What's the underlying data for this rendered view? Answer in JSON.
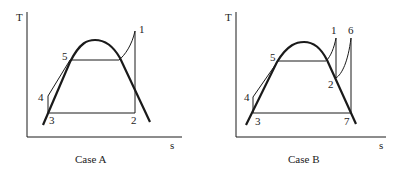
{
  "diagrams": [
    {
      "id": "case-a",
      "caption": "Case A",
      "axis_y_label": "T",
      "axis_x_label": "s",
      "points": {
        "p1": "1",
        "p2": "2",
        "p3": "3",
        "p4": "4",
        "p5": "5"
      }
    },
    {
      "id": "case-b",
      "caption": "Case B",
      "axis_y_label": "T",
      "axis_x_label": "s",
      "points": {
        "p1": "1",
        "p2": "2",
        "p3": "3",
        "p4": "4",
        "p5": "5",
        "p6": "6",
        "p7": "7"
      }
    }
  ],
  "colors": {
    "line": "#1a1a1a",
    "background": "#ffffff"
  }
}
